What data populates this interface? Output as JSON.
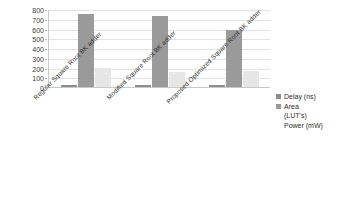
{
  "chart_data": {
    "type": "bar",
    "title": "",
    "xlabel": "",
    "ylabel": "",
    "ylim": [
      0,
      800
    ],
    "yticks": [
      0,
      100,
      200,
      300,
      400,
      500,
      600,
      700,
      800
    ],
    "grid": true,
    "legend_position": "right",
    "categories": [
      "Regular Square Root BK adder",
      "Modified Square Root BK adder",
      "Proposed Optimized Square Root BK adder"
    ],
    "series": [
      {
        "name": "Delay (ns)",
        "values": [
          22,
          21,
          20
        ],
        "color": "#8d8d8d"
      },
      {
        "name": "Area (LUT's)",
        "values": [
          745,
          725,
          580
        ],
        "color": "#9a9a9a"
      },
      {
        "name": "Power (mW)",
        "values": [
          195,
          155,
          160
        ],
        "color": "#e6e6e6"
      }
    ]
  },
  "legend": {
    "entries": [
      {
        "label": "Delay (ns)",
        "swatch": true
      },
      {
        "label": "Area\n(LUT's)",
        "swatch": true
      },
      {
        "label": "Power (mW)",
        "swatch": false
      }
    ]
  }
}
